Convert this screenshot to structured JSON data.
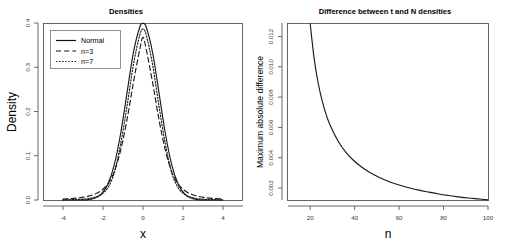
{
  "figure": {
    "background_color": "#ffffff",
    "line_color": "#1a1a1a",
    "axis_color": "#555555",
    "panel_count": 2
  },
  "chart_data": [
    {
      "type": "line",
      "panel": "left",
      "title": "Densities",
      "xlabel": "x",
      "ylabel": "Density",
      "xlim": [
        -5,
        5
      ],
      "ylim": [
        0,
        0.4
      ],
      "grid": false,
      "legend_position": "top-left",
      "xticks": [
        "-4",
        "-2",
        "0",
        "2",
        "4"
      ],
      "xtick_values": [
        -4,
        -2,
        0,
        2,
        4
      ],
      "yticks": [
        "0.0",
        "0.1",
        "0.2",
        "0.3",
        "0.4"
      ],
      "ytick_values": [
        0.0,
        0.1,
        0.2,
        0.3,
        0.4
      ],
      "x": [
        -5,
        -4.6,
        -4.2,
        -3.8,
        -3.4,
        -3,
        -2.6,
        -2.2,
        -1.8,
        -1.4,
        -1,
        -0.6,
        -0.2,
        0,
        0.2,
        0.6,
        1,
        1.4,
        1.8,
        2.2,
        2.6,
        3,
        3.4,
        3.8,
        4.2,
        4.6,
        5
      ],
      "series": [
        {
          "name": "Normal",
          "style": "solid",
          "values": [
            1.5e-06,
            8.9e-06,
            4.61e-05,
            0.000209,
            0.000827,
            0.004432,
            0.01358,
            0.03547,
            0.07895,
            0.14973,
            0.24197,
            0.33322,
            0.39104,
            0.39894,
            0.39104,
            0.33322,
            0.24197,
            0.14973,
            0.07895,
            0.03547,
            0.01358,
            0.004432,
            0.000827,
            0.000209,
            4.61e-05,
            8.9e-06,
            1.5e-06
          ]
        },
        {
          "name": "n=3",
          "style": "dashed",
          "values": [
            0.00219,
            0.00299,
            0.00418,
            0.00599,
            0.00884,
            0.0135,
            0.02151,
            0.036,
            0.06349,
            0.11204,
            0.18138,
            0.26549,
            0.34082,
            0.36755,
            0.34082,
            0.26549,
            0.18138,
            0.11204,
            0.06349,
            0.036,
            0.02151,
            0.0135,
            0.00884,
            0.00599,
            0.00418,
            0.00299,
            0.00219
          ]
        },
        {
          "name": "n=7",
          "style": "dotted",
          "values": [
            0.0004,
            0.00064,
            0.00107,
            0.00185,
            0.00336,
            0.0064,
            0.01292,
            0.02763,
            0.06117,
            0.12614,
            0.21173,
            0.30575,
            0.37292,
            0.38613,
            0.37292,
            0.30575,
            0.21173,
            0.12614,
            0.06117,
            0.02763,
            0.01292,
            0.0064,
            0.00336,
            0.00185,
            0.00107,
            0.00064,
            0.0004
          ]
        }
      ],
      "legend": [
        {
          "label": "Normal",
          "style": "solid"
        },
        {
          "label": "n=3",
          "style": "dashed"
        },
        {
          "label": "n=7",
          "style": "dotted"
        }
      ]
    },
    {
      "type": "line",
      "panel": "right",
      "title": "Difference between t and N densities",
      "xlabel": "n",
      "ylabel": "Maximum absolute difference",
      "xlim": [
        10,
        100
      ],
      "ylim": [
        0.0012,
        0.0129
      ],
      "grid": false,
      "legend_position": "none",
      "xticks": [
        "20",
        "40",
        "60",
        "80",
        "100"
      ],
      "xtick_values": [
        20,
        40,
        60,
        80,
        100
      ],
      "yticks": [
        "0.002",
        "0.004",
        "0.006",
        "0.008",
        "0.010",
        "0.012"
      ],
      "ytick_values": [
        0.002,
        0.004,
        0.006,
        0.008,
        0.01,
        0.012
      ],
      "x": [
        10,
        12,
        14,
        16,
        18,
        20,
        24,
        28,
        32,
        36,
        40,
        45,
        50,
        55,
        60,
        65,
        70,
        75,
        80,
        85,
        90,
        95,
        100
      ],
      "series": [
        {
          "name": "Maximum absolute difference",
          "style": "solid",
          "values": [
            0.01285,
            0.01055,
            0.00895,
            0.00778,
            0.00688,
            0.00617,
            0.00512,
            0.00437,
            0.00381,
            0.00338,
            0.00303,
            0.00269,
            0.00241,
            0.00219,
            0.00201,
            0.00185,
            0.00172,
            0.0016,
            0.0015,
            0.00141,
            0.00133,
            0.00127,
            0.00121
          ]
        }
      ]
    }
  ]
}
